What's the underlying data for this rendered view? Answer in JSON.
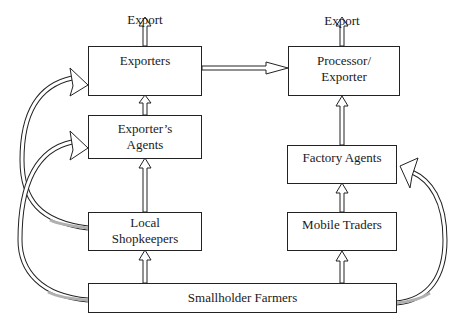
{
  "caption": "Figure : Types of vanilla exporters and their procurement routes",
  "export_labels": {
    "left": "Export",
    "right": "Export"
  },
  "nodes": {
    "exporters": {
      "line1": "Exporters",
      "line2": ""
    },
    "processor_exporter": {
      "line1": "Processor/",
      "line2": "Exporter"
    },
    "exporters_agents": {
      "line1": "Exporter’s",
      "line2": "Agents"
    },
    "factory_agents": {
      "line1": "Factory Agents",
      "line2": ""
    },
    "local_shopkeepers": {
      "line1": "Local",
      "line2": "Shopkeepers"
    },
    "mobile_traders": {
      "line1": "Mobile Traders",
      "line2": ""
    },
    "smallholder_farmers": {
      "line1": "Smallholder Farmers"
    }
  },
  "edges": [
    {
      "from": "Exporters",
      "to": "Export"
    },
    {
      "from": "Processor/Exporter",
      "to": "Export"
    },
    {
      "from": "Exporters",
      "to": "Processor/Exporter"
    },
    {
      "from": "Exporter's Agents",
      "to": "Exporters"
    },
    {
      "from": "Local Shopkeepers",
      "to": "Exporter's Agents"
    },
    {
      "from": "Smallholder Farmers",
      "to": "Local Shopkeepers"
    },
    {
      "from": "Local Shopkeepers",
      "to": "Exporters",
      "style": "curved"
    },
    {
      "from": "Smallholder Farmers",
      "to": "Exporter's Agents",
      "style": "curved"
    },
    {
      "from": "Factory Agents",
      "to": "Processor/Exporter"
    },
    {
      "from": "Mobile Traders",
      "to": "Factory Agents"
    },
    {
      "from": "Smallholder Farmers",
      "to": "Mobile Traders"
    },
    {
      "from": "Smallholder Farmers",
      "to": "Factory Agents",
      "style": "curved"
    }
  ],
  "colors": {
    "stroke": "#222222",
    "arrow_fill": "#ffffff",
    "arrow_tail_shade": "#b0b0b0"
  }
}
